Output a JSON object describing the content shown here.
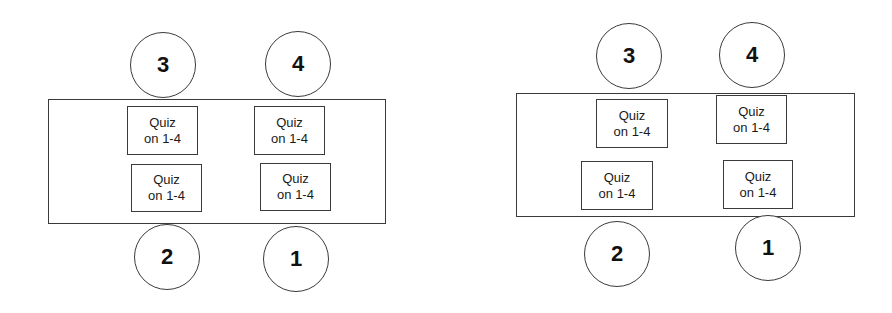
{
  "diagrams": [
    {
      "name": "arrangement-a",
      "table": {
        "x": 48,
        "y": 99,
        "w": 338,
        "h": 125
      },
      "seats": [
        {
          "label": "3",
          "cx": 163,
          "cy": 65,
          "r": 33
        },
        {
          "label": "4",
          "cx": 298,
          "cy": 64,
          "r": 33
        },
        {
          "label": "2",
          "cx": 167,
          "cy": 257,
          "r": 33
        },
        {
          "label": "1",
          "cx": 296,
          "cy": 259,
          "r": 33
        }
      ],
      "quizzes": [
        {
          "line1": "Quiz",
          "line2": "on 1-4",
          "x": 127,
          "y": 106,
          "w": 71,
          "h": 49
        },
        {
          "line1": "Quiz",
          "line2": "on 1-4",
          "x": 254,
          "y": 106,
          "w": 71,
          "h": 49
        },
        {
          "line1": "Quiz",
          "line2": "on 1-4",
          "x": 131,
          "y": 164,
          "w": 71,
          "h": 48
        },
        {
          "line1": "Quiz",
          "line2": "on 1-4",
          "x": 260,
          "y": 163,
          "w": 71,
          "h": 48
        }
      ]
    },
    {
      "name": "arrangement-b",
      "table": {
        "x": 516,
        "y": 93,
        "w": 339,
        "h": 124
      },
      "seats": [
        {
          "label": "3",
          "cx": 629,
          "cy": 56,
          "r": 33
        },
        {
          "label": "4",
          "cx": 752,
          "cy": 55,
          "r": 33
        },
        {
          "label": "2",
          "cx": 617,
          "cy": 254,
          "r": 33
        },
        {
          "label": "1",
          "cx": 768,
          "cy": 248,
          "r": 33
        }
      ],
      "quizzes": [
        {
          "line1": "Quiz",
          "line2": "on 1-4",
          "x": 596,
          "y": 99,
          "w": 72,
          "h": 49
        },
        {
          "line1": "Quiz",
          "line2": "on 1-4",
          "x": 716,
          "y": 95,
          "w": 71,
          "h": 49
        },
        {
          "line1": "Quiz",
          "line2": "on 1-4",
          "x": 581,
          "y": 161,
          "w": 72,
          "h": 49
        },
        {
          "line1": "Quiz",
          "line2": "on 1-4",
          "x": 723,
          "y": 160,
          "w": 70,
          "h": 49
        }
      ]
    }
  ]
}
